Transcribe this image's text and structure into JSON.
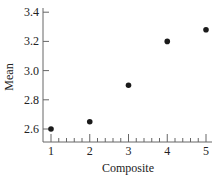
{
  "chart_data": {
    "type": "scatter",
    "title": "",
    "xlabel": "Composite",
    "ylabel": "Mean",
    "x": [
      1,
      2,
      3,
      4,
      5
    ],
    "series": [
      {
        "name": "Mean",
        "values": [
          2.6,
          2.65,
          2.9,
          3.2,
          3.28
        ]
      }
    ],
    "xticks": [
      "1",
      "2",
      "3",
      "4",
      "5"
    ],
    "yticks": [
      "2.6",
      "2.8",
      "3.0",
      "3.2",
      "3.4"
    ],
    "xlim": [
      0.8,
      5.2
    ],
    "ylim": [
      2.52,
      3.42
    ],
    "grid": false,
    "legend": "none",
    "minor_xticks_per_interval": 4
  },
  "colors": {
    "axis": "#666666",
    "marker": "#1a1a1a",
    "text": "#222222"
  }
}
